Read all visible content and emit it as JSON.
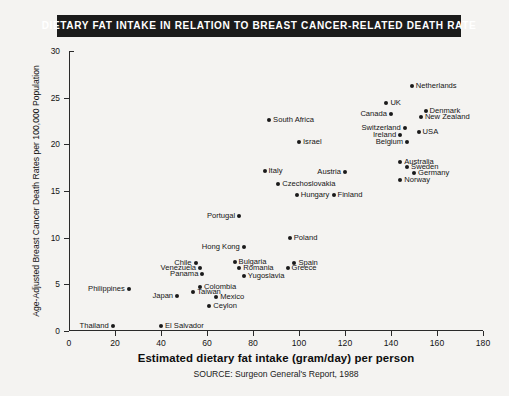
{
  "title": "DIETARY FAT INTAKE IN RELATION TO BREAST CANCER-RELATED DEATH RATE",
  "source": "SOURCE: Surgeon General's Report, 1988",
  "chart_data": {
    "type": "scatter",
    "title": "DIETARY FAT INTAKE IN RELATION TO BREAST CANCER-RELATED DEATH RATE",
    "xlabel": "Estimated dietary fat intake (gram/day) per person",
    "ylabel": "Age-Adjusted Breast Cancer Death Rates per 100,000 Population",
    "xlim": [
      0,
      180
    ],
    "ylim": [
      0,
      30
    ],
    "xticks": [
      0,
      20,
      40,
      60,
      80,
      100,
      120,
      140,
      160,
      180
    ],
    "yticks": [
      0,
      5,
      10,
      15,
      20,
      25,
      30
    ],
    "grid": false,
    "legend": null,
    "point_color": "#1a1a1a",
    "points": [
      {
        "label": "Netherlands",
        "x": 149,
        "y": 26.3,
        "label_side": "right"
      },
      {
        "label": "UK",
        "x": 138,
        "y": 24.4,
        "label_side": "right"
      },
      {
        "label": "Denmark",
        "x": 155,
        "y": 23.6,
        "label_side": "right"
      },
      {
        "label": "New Zealand",
        "x": 153,
        "y": 22.9,
        "label_side": "right"
      },
      {
        "label": "Canada",
        "x": 140,
        "y": 23.2,
        "label_side": "left"
      },
      {
        "label": "Switzerland",
        "x": 146,
        "y": 21.7,
        "label_side": "left"
      },
      {
        "label": "Ireland",
        "x": 144,
        "y": 21.0,
        "label_side": "left"
      },
      {
        "label": "Belgium",
        "x": 147,
        "y": 20.3,
        "label_side": "left"
      },
      {
        "label": "USA",
        "x": 152,
        "y": 21.3,
        "label_side": "right"
      },
      {
        "label": "Australia",
        "x": 144,
        "y": 18.1,
        "label_side": "right"
      },
      {
        "label": "Sweden",
        "x": 147,
        "y": 17.6,
        "label_side": "right"
      },
      {
        "label": "Germany",
        "x": 150,
        "y": 16.9,
        "label_side": "right"
      },
      {
        "label": "Norway",
        "x": 144,
        "y": 16.2,
        "label_side": "right"
      },
      {
        "label": "Austria",
        "x": 120,
        "y": 17.0,
        "label_side": "left"
      },
      {
        "label": "South Africa",
        "x": 87,
        "y": 22.6,
        "label_side": "right"
      },
      {
        "label": "Israel",
        "x": 100,
        "y": 20.2,
        "label_side": "right"
      },
      {
        "label": "Italy",
        "x": 85,
        "y": 17.1,
        "label_side": "right"
      },
      {
        "label": "Czechoslovakia",
        "x": 91,
        "y": 15.8,
        "label_side": "right"
      },
      {
        "label": "Hungary",
        "x": 99,
        "y": 14.6,
        "label_side": "right"
      },
      {
        "label": "Finland",
        "x": 115,
        "y": 14.6,
        "label_side": "right"
      },
      {
        "label": "Portugal",
        "x": 74,
        "y": 12.3,
        "label_side": "left"
      },
      {
        "label": "Poland",
        "x": 96,
        "y": 10.0,
        "label_side": "right"
      },
      {
        "label": "Hong Kong",
        "x": 76,
        "y": 9.0,
        "label_side": "left"
      },
      {
        "label": "Bulgaria",
        "x": 72,
        "y": 7.4,
        "label_side": "right"
      },
      {
        "label": "Romania",
        "x": 74,
        "y": 6.7,
        "label_side": "right"
      },
      {
        "label": "Yugoslavia",
        "x": 76,
        "y": 5.9,
        "label_side": "right"
      },
      {
        "label": "Spain",
        "x": 98,
        "y": 7.3,
        "label_side": "right"
      },
      {
        "label": "Greece",
        "x": 95,
        "y": 6.7,
        "label_side": "right"
      },
      {
        "label": "Chile",
        "x": 55,
        "y": 7.3,
        "label_side": "left"
      },
      {
        "label": "Venezuela",
        "x": 57,
        "y": 6.7,
        "label_side": "left"
      },
      {
        "label": "Panama",
        "x": 58,
        "y": 6.1,
        "label_side": "left"
      },
      {
        "label": "Colombia",
        "x": 57,
        "y": 4.7,
        "label_side": "right"
      },
      {
        "label": "Taiwan",
        "x": 54,
        "y": 4.2,
        "label_side": "right"
      },
      {
        "label": "Mexico",
        "x": 64,
        "y": 3.6,
        "label_side": "right"
      },
      {
        "label": "Japan",
        "x": 47,
        "y": 3.7,
        "label_side": "left"
      },
      {
        "label": "Philippines",
        "x": 26,
        "y": 4.5,
        "label_side": "left"
      },
      {
        "label": "Ceylon",
        "x": 61,
        "y": 2.7,
        "label_side": "right"
      },
      {
        "label": "Thailand",
        "x": 19,
        "y": 0.5,
        "label_side": "left"
      },
      {
        "label": "El Salvador",
        "x": 40,
        "y": 0.5,
        "label_side": "right"
      }
    ]
  }
}
